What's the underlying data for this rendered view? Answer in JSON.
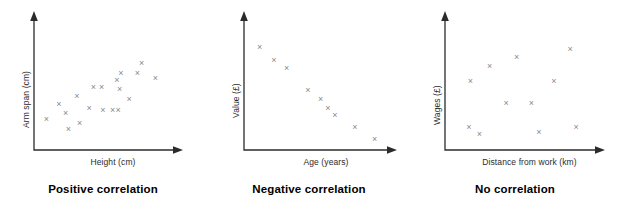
{
  "figure": {
    "title": "",
    "background": "#ffffff",
    "marker_color": "#8a8a8a",
    "axis_color": "#2b2b2b",
    "caption_color": "#000000"
  },
  "chart_data": [
    {
      "type": "scatter",
      "title": "Positive correlation",
      "xlabel": "Height (cm)",
      "ylabel": "Arm span (cm)",
      "xlim": [
        0,
        100
      ],
      "ylim": [
        0,
        100
      ],
      "grid": false,
      "legend": "none",
      "marker": "x",
      "points": [
        {
          "x": 9,
          "y": 24
        },
        {
          "x": 18,
          "y": 36
        },
        {
          "x": 23,
          "y": 29
        },
        {
          "x": 25,
          "y": 15
        },
        {
          "x": 31,
          "y": 43
        },
        {
          "x": 33,
          "y": 20
        },
        {
          "x": 40,
          "y": 33
        },
        {
          "x": 43,
          "y": 50
        },
        {
          "x": 49,
          "y": 50
        },
        {
          "x": 50,
          "y": 31
        },
        {
          "x": 57,
          "y": 31
        },
        {
          "x": 60,
          "y": 56
        },
        {
          "x": 61,
          "y": 31
        },
        {
          "x": 62,
          "y": 49
        },
        {
          "x": 63,
          "y": 62
        },
        {
          "x": 69,
          "y": 40
        },
        {
          "x": 75,
          "y": 62
        },
        {
          "x": 78,
          "y": 70
        },
        {
          "x": 88,
          "y": 58
        }
      ]
    },
    {
      "type": "scatter",
      "title": "Negative correlation",
      "xlabel": "Age (years)",
      "ylabel": "Value (£)",
      "xlim": [
        0,
        100
      ],
      "ylim": [
        0,
        100
      ],
      "grid": false,
      "legend": "none",
      "marker": "x",
      "points": [
        {
          "x": 11,
          "y": 84
        },
        {
          "x": 21,
          "y": 73
        },
        {
          "x": 30,
          "y": 66
        },
        {
          "x": 45,
          "y": 48
        },
        {
          "x": 54,
          "y": 40
        },
        {
          "x": 59,
          "y": 33
        },
        {
          "x": 64,
          "y": 27
        },
        {
          "x": 78,
          "y": 17
        },
        {
          "x": 92,
          "y": 7
        }
      ]
    },
    {
      "type": "scatter",
      "title": "No correlation",
      "xlabel": "Distance from work (km)",
      "ylabel": "Wages (£)",
      "xlim": [
        0,
        100
      ],
      "ylim": [
        0,
        100
      ],
      "grid": false,
      "legend": "none",
      "marker": "x",
      "points": [
        {
          "x": 17,
          "y": 55
        },
        {
          "x": 16,
          "y": 17
        },
        {
          "x": 23,
          "y": 11
        },
        {
          "x": 30,
          "y": 68
        },
        {
          "x": 41,
          "y": 37
        },
        {
          "x": 48,
          "y": 75
        },
        {
          "x": 58,
          "y": 37
        },
        {
          "x": 63,
          "y": 13
        },
        {
          "x": 73,
          "y": 55
        },
        {
          "x": 84,
          "y": 82
        },
        {
          "x": 88,
          "y": 17
        }
      ]
    }
  ],
  "panels": [
    {
      "id": "positive",
      "caption": "Positive correlation",
      "ylabel": "Arm span (cm)",
      "xlabel": "Height (cm)"
    },
    {
      "id": "negative",
      "caption": "Negative correlation",
      "ylabel": "Value (£)",
      "xlabel": "Age (years)"
    },
    {
      "id": "none",
      "caption": "No correlation",
      "ylabel": "Wages (£)",
      "xlabel": "Distance from work (km)"
    }
  ]
}
